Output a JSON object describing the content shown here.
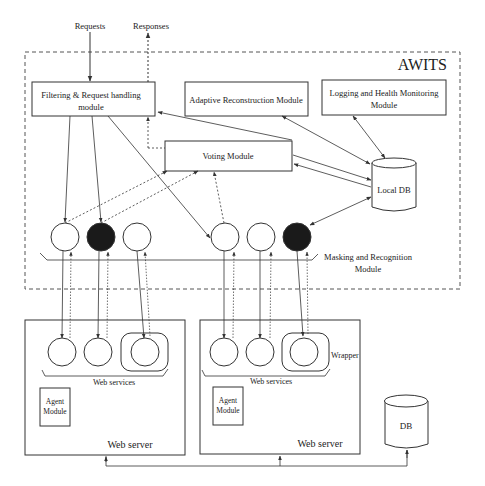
{
  "diagram": {
    "title": "AWITS",
    "external": {
      "requests_label": "Requests",
      "responses_label": "Responses"
    },
    "modules": {
      "filtering": {
        "line1": "Filtering &  Request handling",
        "line2": "module"
      },
      "adaptive": {
        "label": "Adaptive Reconstruction Module"
      },
      "logging": {
        "line1": "Logging and Health Monitoring",
        "line2": "Module"
      },
      "voting": {
        "label": "Voting Module"
      },
      "local_db": {
        "label": "Local DB"
      },
      "masking": {
        "line1": "Masking and Recognition",
        "line2": "Module"
      }
    },
    "masking_nodes": [
      {
        "id": "m1",
        "filled": false
      },
      {
        "id": "m2",
        "filled": true
      },
      {
        "id": "m3",
        "filled": false
      },
      {
        "id": "m4",
        "filled": false
      },
      {
        "id": "m5",
        "filled": false
      },
      {
        "id": "m6",
        "filled": true
      }
    ],
    "web_servers": [
      {
        "label": "Web server",
        "services_label": "Web services",
        "agent": {
          "line1": "Agent",
          "line2": "Module"
        },
        "services": [
          "ws1",
          "ws2",
          "ws3-wrapped"
        ]
      },
      {
        "label": "Web server",
        "services_label": "Web services",
        "wrapper_label": "Wrapper",
        "agent": {
          "line1": "Agent",
          "line2": "Module"
        },
        "services": [
          "ws1",
          "ws2",
          "ws3-wrapped"
        ]
      }
    ],
    "db": {
      "label": "DB"
    },
    "colors": {
      "stroke": "#333333",
      "filled_node": "#1a1a1a",
      "background": "#ffffff"
    }
  }
}
